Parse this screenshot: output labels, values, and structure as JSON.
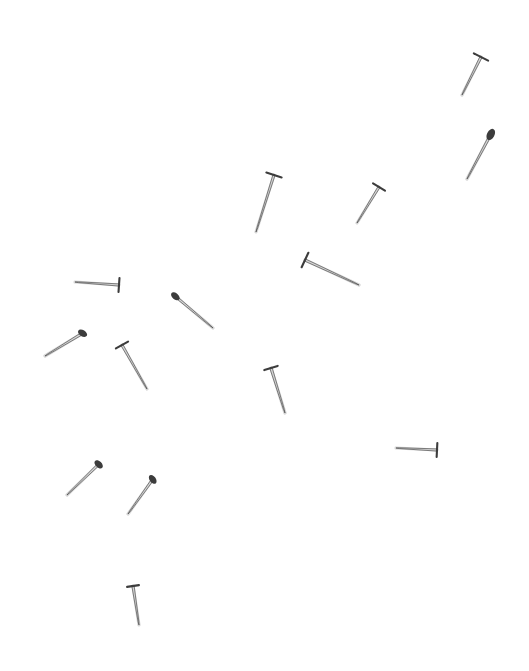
{
  "image": {
    "title": "Scattered nails on white background",
    "subject": "nails",
    "object_count": 14,
    "background_color": "#ffffff",
    "ink_color": "#3c3c3c",
    "ink_color_light": "#6b6b6b",
    "width": 529,
    "height": 671,
    "medium": "scanned photograph",
    "arrangement": "randomly scattered, non-overlapping"
  },
  "objects": [
    {
      "id": "nail-1",
      "label": "nail",
      "head_x": 481,
      "head_y": 57,
      "tip_x": 462,
      "tip_y": 95,
      "head_style": "flat-bar",
      "head_half_width": 8,
      "shaft_width": 2.3,
      "angle_deg": 117,
      "length_px": 42
    },
    {
      "id": "nail-2",
      "label": "nail",
      "head_x": 491,
      "head_y": 134,
      "tip_x": 467,
      "tip_y": 179,
      "head_style": "blob",
      "head_half_width": 6,
      "shaft_width": 2.4,
      "angle_deg": 118,
      "length_px": 51
    },
    {
      "id": "nail-3",
      "label": "nail",
      "head_x": 274,
      "head_y": 175,
      "tip_x": 256,
      "tip_y": 232,
      "head_style": "flat-bar",
      "head_half_width": 8,
      "shaft_width": 2.2,
      "angle_deg": 108,
      "length_px": 60
    },
    {
      "id": "nail-4",
      "label": "nail",
      "head_x": 379,
      "head_y": 187,
      "tip_x": 357,
      "tip_y": 223,
      "head_style": "flat-bar",
      "head_half_width": 7,
      "shaft_width": 2.2,
      "angle_deg": 121,
      "length_px": 42
    },
    {
      "id": "nail-5",
      "label": "nail",
      "head_x": 305,
      "head_y": 260,
      "tip_x": 359,
      "tip_y": 285,
      "head_style": "flat-bar",
      "head_half_width": 8,
      "shaft_width": 2.3,
      "angle_deg": 25,
      "length_px": 60
    },
    {
      "id": "nail-6",
      "label": "nail",
      "head_x": 119,
      "head_y": 285,
      "tip_x": 75,
      "tip_y": 282,
      "head_style": "flat-bar",
      "head_half_width": 7,
      "shaft_width": 2.2,
      "angle_deg": 184,
      "length_px": 44
    },
    {
      "id": "nail-7",
      "label": "nail",
      "head_x": 175,
      "head_y": 296,
      "tip_x": 213,
      "tip_y": 328,
      "head_style": "blob",
      "head_half_width": 5,
      "shaft_width": 2.2,
      "angle_deg": 40,
      "length_px": 50
    },
    {
      "id": "nail-8",
      "label": "nail",
      "head_x": 83,
      "head_y": 333,
      "tip_x": 45,
      "tip_y": 356,
      "head_style": "blob",
      "head_half_width": 5,
      "shaft_width": 2.4,
      "angle_deg": 211,
      "length_px": 45
    },
    {
      "id": "nail-9",
      "label": "nail",
      "head_x": 122,
      "head_y": 345,
      "tip_x": 147,
      "tip_y": 389,
      "head_style": "flat-bar",
      "head_half_width": 7,
      "shaft_width": 2.2,
      "angle_deg": 60,
      "length_px": 50
    },
    {
      "id": "nail-10",
      "label": "nail",
      "head_x": 271,
      "head_y": 368,
      "tip_x": 285,
      "tip_y": 413,
      "head_style": "flat-bar",
      "head_half_width": 7,
      "shaft_width": 2.4,
      "angle_deg": 73,
      "length_px": 47
    },
    {
      "id": "nail-11",
      "label": "nail",
      "head_x": 437,
      "head_y": 450,
      "tip_x": 396,
      "tip_y": 448,
      "head_style": "flat-bar",
      "head_half_width": 7,
      "shaft_width": 2.2,
      "angle_deg": 183,
      "length_px": 41
    },
    {
      "id": "nail-12",
      "label": "nail",
      "head_x": 99,
      "head_y": 464,
      "tip_x": 67,
      "tip_y": 495,
      "head_style": "blob",
      "head_half_width": 5,
      "shaft_width": 2.3,
      "angle_deg": 224,
      "length_px": 45
    },
    {
      "id": "nail-13",
      "label": "nail",
      "head_x": 153,
      "head_y": 479,
      "tip_x": 128,
      "tip_y": 514,
      "head_style": "blob",
      "head_half_width": 5,
      "shaft_width": 2.3,
      "angle_deg": 234,
      "length_px": 43
    },
    {
      "id": "nail-14",
      "label": "nail",
      "head_x": 133,
      "head_y": 586,
      "tip_x": 139,
      "tip_y": 625,
      "head_style": "flat-bar",
      "head_half_width": 6,
      "shaft_width": 2.3,
      "angle_deg": 81,
      "length_px": 39
    }
  ]
}
